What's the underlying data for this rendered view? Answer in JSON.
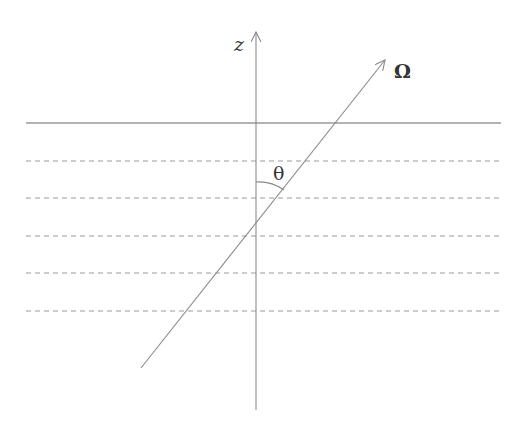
{
  "diagram": {
    "axis_label": "z",
    "direction_label": "Ω",
    "angle_label": "θ",
    "colors": {
      "line": "#8a8a8a",
      "text": "#333333",
      "background": "#ffffff"
    },
    "layers": {
      "surface_line": "solid",
      "dashed_layer_count": 5
    }
  }
}
